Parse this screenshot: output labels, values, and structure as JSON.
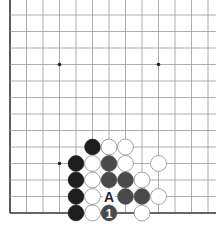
{
  "board": {
    "origin_x": 10,
    "bottom_y": 213,
    "spacing": 16.5,
    "cols": 13,
    "rows": 13,
    "right_x": 216,
    "top_y": 0,
    "line_color": "#9a9a9a",
    "edge_color": "#333333",
    "star_points": [
      [
        3,
        9
      ],
      [
        9,
        9
      ],
      [
        3,
        3
      ]
    ]
  },
  "colors": {
    "black_stone": "#1e1e1e",
    "gray_stone": "#4a4a4a",
    "white_stone": "#ffffff",
    "white_stroke": "#8a8a8a"
  },
  "stones": [
    {
      "col": 5,
      "row": 4,
      "color": "black"
    },
    {
      "col": 6,
      "row": 4,
      "color": "white"
    },
    {
      "col": 7,
      "row": 4,
      "color": "white"
    },
    {
      "col": 4,
      "row": 3,
      "color": "black"
    },
    {
      "col": 5,
      "row": 3,
      "color": "white"
    },
    {
      "col": 6,
      "row": 3,
      "color": "gray"
    },
    {
      "col": 7,
      "row": 3,
      "color": "white"
    },
    {
      "col": 9,
      "row": 3,
      "color": "white"
    },
    {
      "col": 4,
      "row": 2,
      "color": "black"
    },
    {
      "col": 5,
      "row": 2,
      "color": "white"
    },
    {
      "col": 6,
      "row": 2,
      "color": "gray"
    },
    {
      "col": 7,
      "row": 2,
      "color": "gray"
    },
    {
      "col": 8,
      "row": 2,
      "color": "white"
    },
    {
      "col": 4,
      "row": 1,
      "color": "black"
    },
    {
      "col": 5,
      "row": 1,
      "color": "white"
    },
    {
      "col": 7,
      "row": 1,
      "color": "gray"
    },
    {
      "col": 8,
      "row": 1,
      "color": "gray"
    },
    {
      "col": 9,
      "row": 1,
      "color": "white"
    },
    {
      "col": 4,
      "row": 0,
      "color": "black"
    },
    {
      "col": 5,
      "row": 0,
      "color": "white"
    },
    {
      "col": 6,
      "row": 0,
      "color": "gray",
      "label": "1"
    },
    {
      "col": 8,
      "row": 0,
      "color": "white"
    }
  ],
  "markers": [
    {
      "col": 6,
      "row": 1,
      "label": "A"
    }
  ]
}
